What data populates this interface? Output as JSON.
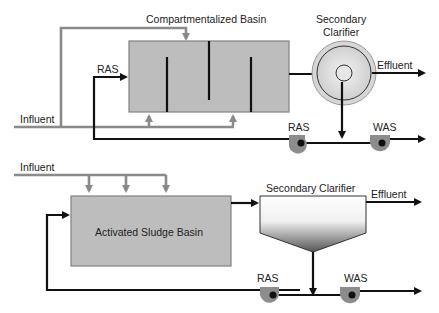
{
  "colors": {
    "basin_fill": "#bdbdbd",
    "basin_stroke": "#808080",
    "influent_line": "#8a8a8a",
    "flow_line": "#111111",
    "pump_fill": "#8c8c8c",
    "clarifier_ring": "#d6d6d6"
  },
  "top_diagram": {
    "basin_label": "Compartmentalized Basin",
    "clarifier_label_line1": "Secondary",
    "clarifier_label_line2": "Clarifier",
    "influent_label": "Influent",
    "ras_inlet_label": "RAS",
    "effluent_label": "Effluent",
    "ras_pump_label": "RAS",
    "was_pump_label": "WAS"
  },
  "bottom_diagram": {
    "influent_label": "Influent",
    "basin_label": "Activated Sludge Basin",
    "clarifier_label": "Secondary Clarifier",
    "effluent_label": "Effluent",
    "ras_pump_label": "RAS",
    "was_pump_label": "WAS"
  }
}
